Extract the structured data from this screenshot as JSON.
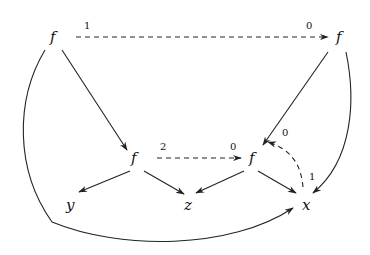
{
  "diagram": {
    "type": "directed-graph",
    "nodes": [
      {
        "id": "f1",
        "label": "f",
        "x": 55,
        "y": 42
      },
      {
        "id": "f2",
        "label": "f",
        "x": 342,
        "y": 42
      },
      {
        "id": "f3",
        "label": "f",
        "x": 136,
        "y": 163
      },
      {
        "id": "f4",
        "label": "f",
        "x": 254,
        "y": 163
      },
      {
        "id": "y",
        "label": "y",
        "x": 70,
        "y": 210
      },
      {
        "id": "z",
        "label": "z",
        "x": 188,
        "y": 210
      },
      {
        "id": "x",
        "label": "x",
        "x": 307,
        "y": 210
      }
    ],
    "edges": [
      {
        "from": "f1",
        "to": "f2",
        "style": "dashed",
        "labels": {
          "source": "1",
          "target": "0"
        }
      },
      {
        "from": "f3",
        "to": "f4",
        "style": "dashed",
        "labels": {
          "source": "2",
          "target": "0"
        }
      },
      {
        "from": "x",
        "to": "f4",
        "style": "dashed-curved",
        "labels": {
          "source": "1",
          "target": "0"
        }
      },
      {
        "from": "f1",
        "to": "f3",
        "style": "solid"
      },
      {
        "from": "f2",
        "to": "f4",
        "style": "solid"
      },
      {
        "from": "f3",
        "to": "y",
        "style": "solid"
      },
      {
        "from": "f3",
        "to": "z",
        "style": "solid"
      },
      {
        "from": "f4",
        "to": "z",
        "style": "solid"
      },
      {
        "from": "f4",
        "to": "x",
        "style": "solid"
      },
      {
        "from": "f2",
        "to": "x",
        "style": "solid-curved"
      },
      {
        "from": "f1",
        "to": "x",
        "style": "solid-curved"
      }
    ],
    "edge_labels": {
      "f1_f2_src": "1",
      "f1_f2_tgt": "0",
      "f3_f4_src": "2",
      "f3_f4_tgt": "0",
      "x_f4_src": "1",
      "x_f4_tgt": "0"
    },
    "node_labels": {
      "f1": "f",
      "f2": "f",
      "f3": "f",
      "f4": "f",
      "y": "y",
      "z": "z",
      "x": "x"
    }
  }
}
